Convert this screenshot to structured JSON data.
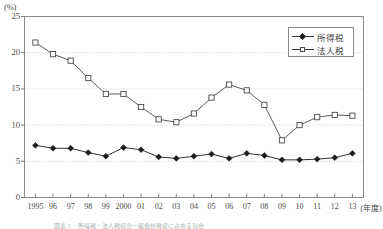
{
  "figure": {
    "y_axis_unit": "(%)",
    "x_axis_unit": "(年度)",
    "caption": "図表 2　 所得税・法人税収の一般会計税収に占める割合"
  },
  "legend": {
    "position": "top-right",
    "entries": [
      {
        "label": "所得税",
        "marker": "filled-diamond",
        "color": "#1c1c1c"
      },
      {
        "label": "法人税",
        "marker": "open-square",
        "color": "#4a4a4a"
      }
    ]
  },
  "chart_data": {
    "type": "line",
    "title": "",
    "xlabel": "(年度)",
    "ylabel": "(%)",
    "ylim": [
      0,
      25
    ],
    "yticks": [
      0,
      5,
      10,
      15,
      20,
      25
    ],
    "ytick_labels": [
      "0",
      "5",
      "10",
      "15",
      "20",
      "25"
    ],
    "grid": true,
    "grid_axis": "y",
    "legend_position": "top-right",
    "categories": [
      "1995",
      "96",
      "97",
      "98",
      "99",
      "2000",
      "01",
      "02",
      "03",
      "04",
      "05",
      "06",
      "07",
      "08",
      "09",
      "10",
      "11",
      "12",
      "13"
    ],
    "series": [
      {
        "name": "所得税",
        "marker": "filled-diamond",
        "color": "#1c1c1c",
        "values": [
          7.2,
          6.8,
          6.8,
          6.2,
          5.7,
          6.9,
          6.6,
          5.6,
          5.4,
          5.7,
          6.0,
          5.4,
          6.1,
          5.8,
          5.2,
          5.2,
          5.3,
          5.5,
          6.1
        ]
      },
      {
        "name": "法人税",
        "marker": "open-square",
        "color": "#4a4a4a",
        "values": [
          21.4,
          19.8,
          18.9,
          16.5,
          14.3,
          14.3,
          12.5,
          10.8,
          10.4,
          11.6,
          13.8,
          15.6,
          14.8,
          12.8,
          7.9,
          10.0,
          11.1,
          11.4,
          11.3
        ]
      }
    ]
  }
}
